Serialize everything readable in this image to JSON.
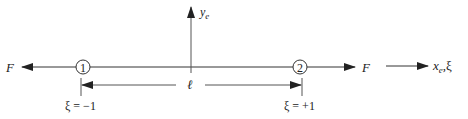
{
  "diagram": {
    "type": "bar-element-1d",
    "colors": {
      "line": "#333333",
      "text": "#222222",
      "background": "#ffffff"
    },
    "force_left": {
      "label": "F",
      "direction": "left"
    },
    "force_right": {
      "label": "F",
      "direction": "right"
    },
    "nodes": [
      {
        "id": "1",
        "label": "1",
        "xi_label": "ξ = −1"
      },
      {
        "id": "2",
        "label": "2",
        "xi_label": "ξ = +1"
      }
    ],
    "y_axis": {
      "label_main": "y",
      "label_sub": "e"
    },
    "x_axis": {
      "label_main": "x",
      "label_sub": "e",
      "label_suffix": ",ξ"
    },
    "length": {
      "label": "ℓ"
    }
  }
}
